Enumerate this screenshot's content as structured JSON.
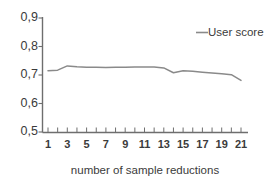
{
  "chart_data": {
    "type": "line",
    "title": "",
    "xlabel": "number of sample reductions",
    "ylabel": "",
    "x": [
      1,
      2,
      3,
      4,
      5,
      6,
      7,
      8,
      9,
      10,
      11,
      12,
      13,
      14,
      15,
      16,
      17,
      18,
      19,
      20,
      21
    ],
    "series": [
      {
        "name": "User score",
        "values": [
          0.715,
          0.717,
          0.732,
          0.729,
          0.727,
          0.727,
          0.726,
          0.727,
          0.727,
          0.728,
          0.728,
          0.728,
          0.725,
          0.708,
          0.715,
          0.713,
          0.71,
          0.707,
          0.704,
          0.701,
          0.681
        ]
      }
    ],
    "ylim": [
      0.5,
      0.9
    ],
    "xlim": [
      1,
      21
    ],
    "y_ticks": [
      0.5,
      0.6,
      0.7,
      0.8,
      0.9
    ],
    "y_tick_labels": [
      "0,5",
      "0,6",
      "0,7",
      "0,8",
      "0,9"
    ],
    "x_ticks": [
      1,
      2,
      3,
      4,
      5,
      6,
      7,
      8,
      9,
      10,
      11,
      12,
      13,
      14,
      15,
      16,
      17,
      18,
      19,
      20,
      21
    ],
    "x_tick_labels": [
      "1",
      "",
      "3",
      "",
      "5",
      "",
      "7",
      "",
      "9",
      "",
      "11",
      "",
      "13",
      "",
      "15",
      "",
      "17",
      "",
      "19",
      "",
      "21"
    ],
    "grid": false,
    "legend_position": "top-right",
    "legend_entries": [
      "User score"
    ],
    "series_color": "#8a8a8a",
    "axis_color": "#6e6e6e",
    "background_color": "#ffffff",
    "decimal_separator": ","
  }
}
